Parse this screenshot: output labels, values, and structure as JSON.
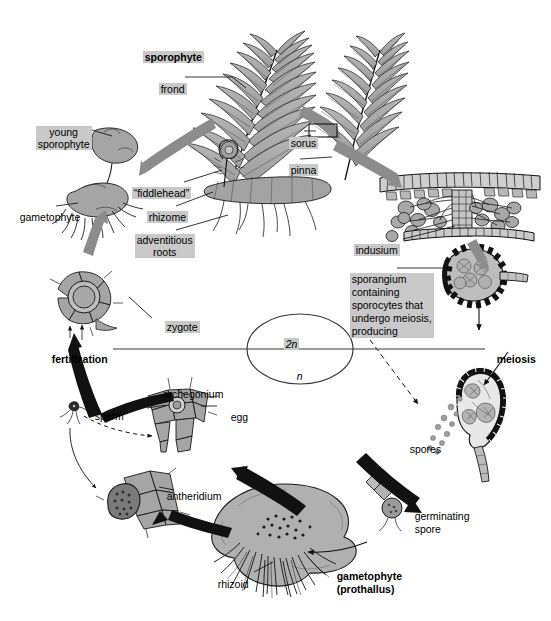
{
  "diagram": {
    "type": "biological-life-cycle-diagram",
    "colors": {
      "background": "#ffffff",
      "label_highlight": "#c9c9c9",
      "tissue_fill": "#a8a8a8",
      "tissue_fill_light": "#bdbdbd",
      "outline": "#1a1a1a",
      "gray_arrow": "#8c8c8c",
      "black_arrow": "#111111"
    },
    "ploidy_markers": {
      "diploid": "2n",
      "haploid": "n"
    },
    "stage_labels": {
      "sporophyte": "sporophyte",
      "frond": "frond",
      "young_sporophyte": "young\nsporophyte",
      "gametophyte_left": "gametophyte",
      "fiddlehead": "“fiddlehead”",
      "rhizome": "rhizome",
      "adventitious_roots": "adventitious\nroots",
      "sorus": "sorus",
      "pinna": "pinna",
      "indusium": "indusium",
      "sporangium_block": "sporangium\ncontaining\nsporocytes that\nundergo meiosis,\nproducing",
      "meiosis": "meiosis",
      "spores": "spores",
      "germinating_spore": "germinating\nspore",
      "gametophyte_prothallus": "gametophyte\n(prothallus)",
      "rhizoid": "rhizoid",
      "antheridium": "antheridium",
      "archegonium": "archegonium",
      "egg": "egg",
      "sperm": "sperm",
      "fertilization": "fertilization",
      "zygote": "zygote"
    },
    "emphasis": {
      "bold_labels": [
        "sporophyte",
        "fertilization",
        "meiosis",
        "gametophyte (prothallus)"
      ],
      "highlighted_labels": [
        "sporophyte",
        "frond",
        "young sporophyte",
        "“fiddlehead”",
        "rhizome",
        "adventitious roots",
        "sorus",
        "pinna",
        "indusium",
        "sporangium containing sporocytes that undergo meiosis, producing",
        "zygote",
        "2n"
      ]
    },
    "cycle_sequence": [
      "sporophyte frond with sori",
      "sorus cross-section with indusium",
      "sporangium containing sporocytes",
      "meiosis",
      "spores released",
      "germinating spore",
      "gametophyte (prothallus)",
      "antheridium produces sperm / archegonium holds egg",
      "fertilization",
      "zygote",
      "young sporophyte on gametophyte",
      "mature sporophyte"
    ]
  }
}
